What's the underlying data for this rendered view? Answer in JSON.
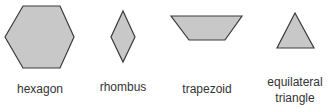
{
  "colors": {
    "fill": "#c8c8c8",
    "stroke": "#3a3a3a"
  },
  "shapes": [
    {
      "name": "hexagon",
      "label": "hexagon"
    },
    {
      "name": "rhombus",
      "label": "rhombus"
    },
    {
      "name": "trapezoid",
      "label": "trapezoid"
    },
    {
      "name": "equilateral-triangle",
      "label_line1": "equilateral",
      "label_line2": "triangle"
    }
  ]
}
